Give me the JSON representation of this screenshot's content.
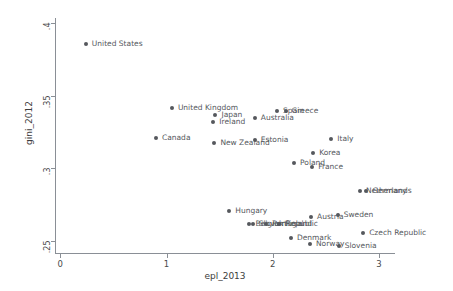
{
  "chart_data": {
    "type": "scatter",
    "title": "",
    "xlabel": "epl_2013",
    "ylabel": "gini_2012",
    "xlim": [
      -0.05,
      3.15
    ],
    "ylim": [
      0.2415,
      0.4035
    ],
    "xticks": [
      0,
      1,
      2,
      3
    ],
    "xtick_labels": [
      "0",
      "1",
      "2",
      "3"
    ],
    "yticks": [
      0.25,
      0.3,
      0.35,
      0.4
    ],
    "ytick_labels": [
      ".25",
      ".3",
      ".35",
      ".4"
    ],
    "grid": false,
    "legend": "none",
    "marker_color": "#55585d",
    "axis_color": "#8a8f96",
    "points": [
      {
        "label": "United States",
        "x": 0.24,
        "y": 0.3855,
        "label_dx": 6,
        "label_dy": -4
      },
      {
        "label": "United Kingdom",
        "x": 1.05,
        "y": 0.3415,
        "label_dx": 6,
        "label_dy": -4
      },
      {
        "label": "Japan",
        "x": 1.46,
        "y": 0.3365,
        "label_dx": 6,
        "label_dy": -4
      },
      {
        "label": "Ireland",
        "x": 1.44,
        "y": 0.3315,
        "label_dx": 6,
        "label_dy": -4
      },
      {
        "label": "Australia",
        "x": 1.83,
        "y": 0.3345,
        "label_dx": 6,
        "label_dy": -4
      },
      {
        "label": "Spain",
        "x": 2.04,
        "y": 0.3395,
        "label_dx": 6,
        "label_dy": -4
      },
      {
        "label": "Greece",
        "x": 2.12,
        "y": 0.3395,
        "label_dx": 6,
        "label_dy": -4
      },
      {
        "label": "Canada",
        "x": 0.9,
        "y": 0.3205,
        "label_dx": 6,
        "label_dy": -4
      },
      {
        "label": "New Zealand",
        "x": 1.45,
        "y": 0.3175,
        "label_dx": 6,
        "label_dy": -4
      },
      {
        "label": "Estonia",
        "x": 1.83,
        "y": 0.3197,
        "label_dx": 6,
        "label_dy": -4
      },
      {
        "label": "Italy",
        "x": 2.55,
        "y": 0.32,
        "label_dx": 6,
        "label_dy": -4
      },
      {
        "label": "Korea",
        "x": 2.38,
        "y": 0.3105,
        "label_dx": 6,
        "label_dy": -4
      },
      {
        "label": "Poland",
        "x": 2.2,
        "y": 0.3035,
        "label_dx": 6,
        "label_dy": -4
      },
      {
        "label": "France",
        "x": 2.37,
        "y": 0.3005,
        "label_dx": 6,
        "label_dy": -4
      },
      {
        "label": "Netherlands",
        "x": 2.82,
        "y": 0.2845,
        "label_dx": 6,
        "label_dy": -4
      },
      {
        "label": "Germany",
        "x": 2.88,
        "y": 0.284,
        "label_dx": 6,
        "label_dy": -4
      },
      {
        "label": "Hungary",
        "x": 1.59,
        "y": 0.2705,
        "label_dx": 6,
        "label_dy": -4
      },
      {
        "label": "Austria",
        "x": 2.36,
        "y": 0.266,
        "label_dx": 6,
        "label_dy": -4
      },
      {
        "label": "Sweden",
        "x": 2.61,
        "y": 0.2675,
        "label_dx": 6,
        "label_dy": -4
      },
      {
        "label": "Belgium",
        "x": 1.78,
        "y": 0.2615,
        "label_dx": 6,
        "label_dy": -4
      },
      {
        "label": "Slovak Republic",
        "x": 1.81,
        "y": 0.2615,
        "label_dx": 6,
        "label_dy": -4
      },
      {
        "label": "Portugal",
        "x": 1.94,
        "y": 0.2612,
        "label_dx": 6,
        "label_dy": -4
      },
      {
        "label": "Finland",
        "x": 2.06,
        "y": 0.2612,
        "label_dx": 6,
        "label_dy": -4
      },
      {
        "label": "Czech Republic",
        "x": 2.85,
        "y": 0.2555,
        "label_dx": 6,
        "label_dy": -4
      },
      {
        "label": "Denmark",
        "x": 2.17,
        "y": 0.252,
        "label_dx": 6,
        "label_dy": -4
      },
      {
        "label": "Norway",
        "x": 2.35,
        "y": 0.2477,
        "label_dx": 6,
        "label_dy": -4
      },
      {
        "label": "Slovenia",
        "x": 2.62,
        "y": 0.2462,
        "label_dx": 6,
        "label_dy": -4
      }
    ]
  }
}
